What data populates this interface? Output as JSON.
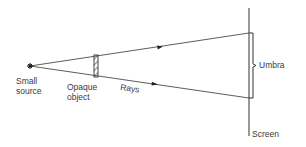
{
  "diagram": {
    "colors": {
      "line": "#333333",
      "text": "#3a3a3a",
      "background": "#ffffff"
    },
    "labels": {
      "source_line1": "Small",
      "source_line2": "source",
      "object_line1": "Opaque",
      "object_line2": "object",
      "rays": "Rays",
      "umbra": "Umbra",
      "screen": "Screen"
    },
    "elements": {
      "source": {
        "x": 30,
        "y": 66,
        "icon": "star-burst"
      },
      "object": {
        "x": 95,
        "y_top": 55,
        "y_bottom": 77,
        "width": 4,
        "style": "hatched"
      },
      "screen": {
        "x": 249,
        "y_top": 8,
        "y_bottom": 136
      },
      "upper_ray_end": {
        "x": 249,
        "y": 33
      },
      "lower_ray_end": {
        "x": 249,
        "y": 98
      },
      "umbra_bracket": {
        "y_top": 33,
        "y_bottom": 98
      }
    }
  }
}
